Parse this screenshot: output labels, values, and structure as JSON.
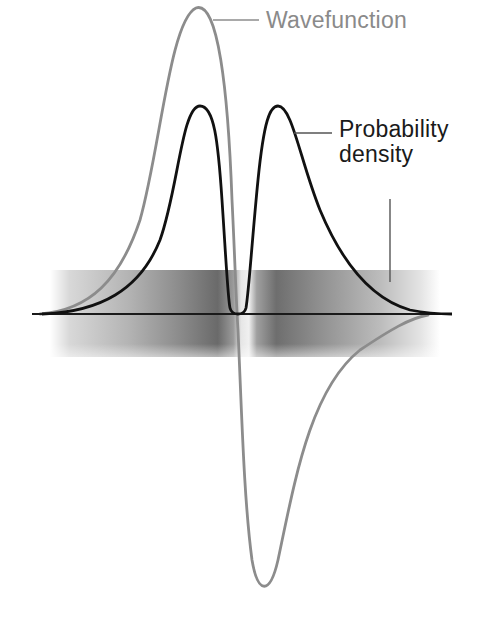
{
  "labels": {
    "wavefunction": "Wavefunction",
    "probability_density_line1": "Probability",
    "probability_density_line2": "density"
  },
  "colors": {
    "wavefunction": "#8c8c8c",
    "probability_density": "#111111",
    "axis": "#1a1a1a",
    "band_dark": "#555555",
    "background": "#ffffff"
  },
  "geometry": {
    "axis_y": 314,
    "axis_x_start": 32,
    "axis_x_end": 452,
    "band_top": 270,
    "band_bottom": 357,
    "band_left": 50,
    "band_right": 440,
    "node_x": 237,
    "wavefunction_peak": [
      196,
      8
    ],
    "wavefunction_trough": [
      240,
      588
    ],
    "density_peaks": [
      [
        200,
        106
      ],
      [
        278,
        106
      ]
    ]
  }
}
